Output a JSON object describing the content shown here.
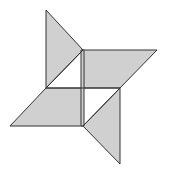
{
  "diagram": {
    "title": "",
    "fill_color": "#d0d0d0",
    "stroke_color": "#333333",
    "background": "#ffffff",
    "shapes": [
      {
        "name": "top-triangle",
        "points": "46,10 83,50 46,88"
      },
      {
        "name": "right-parallelogram",
        "points": "83,50 157,50 120,88 83,88"
      },
      {
        "name": "left-parallelogram",
        "points": "46,88 83,88 83,126 10,126"
      },
      {
        "name": "bottom-triangle",
        "points": "120,88 120,164 83,126"
      },
      {
        "name": "center-strip",
        "points": "81,50 84,50 84,126 81,126"
      }
    ],
    "lines": [
      {
        "name": "horizontal-mid-line",
        "x1": 46,
        "y1": 88,
        "x2": 120,
        "y2": 88
      },
      {
        "name": "diagonal-top",
        "x1": 83,
        "y1": 50,
        "x2": 46,
        "y2": 88
      },
      {
        "name": "diagonal-bottom",
        "x1": 120,
        "y1": 88,
        "x2": 83,
        "y2": 126
      }
    ]
  }
}
